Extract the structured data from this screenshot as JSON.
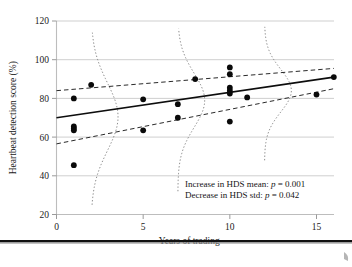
{
  "chart_data": {
    "type": "scatter",
    "title": "",
    "xlabel": "Years of trading",
    "ylabel": "Heartbeat detection score (%)",
    "xlim": [
      -0.6,
      17.2
    ],
    "ylim": [
      18,
      123
    ],
    "xticks": [
      0,
      5,
      10,
      15
    ],
    "xtick_labels": [
      "0",
      "5",
      "10",
      "15"
    ],
    "yticks": [
      20,
      40,
      60,
      80,
      100,
      120
    ],
    "ytick_labels": [
      "20",
      "40",
      "60",
      "80",
      "100",
      "120"
    ],
    "grid": "horizontal",
    "legend": "none",
    "points": [
      {
        "x": 1,
        "y": 80.0
      },
      {
        "x": 1,
        "y": 65.5
      },
      {
        "x": 1,
        "y": 64.5
      },
      {
        "x": 1,
        "y": 63.5
      },
      {
        "x": 1,
        "y": 45.5
      },
      {
        "x": 2,
        "y": 87.0
      },
      {
        "x": 5,
        "y": 79.5
      },
      {
        "x": 5,
        "y": 63.5
      },
      {
        "x": 7,
        "y": 77.0
      },
      {
        "x": 7,
        "y": 70.0
      },
      {
        "x": 8,
        "y": 90.0
      },
      {
        "x": 10,
        "y": 96.0
      },
      {
        "x": 10,
        "y": 92.5
      },
      {
        "x": 10,
        "y": 85.5
      },
      {
        "x": 10,
        "y": 84.0
      },
      {
        "x": 10,
        "y": 82.5
      },
      {
        "x": 10,
        "y": 68.0
      },
      {
        "x": 11,
        "y": 80.5
      },
      {
        "x": 15,
        "y": 82.0
      },
      {
        "x": 16,
        "y": 91.0
      }
    ],
    "fit_line": {
      "name": "regression line",
      "style": "solid",
      "x": [
        0,
        16
      ],
      "y": [
        70.0,
        91.0
      ]
    },
    "bands": [
      {
        "name": "upper band",
        "style": "dashed",
        "x": [
          0,
          16
        ],
        "y": [
          84.0,
          95.5
        ]
      },
      {
        "name": "lower band",
        "style": "dashed",
        "x": [
          0,
          16
        ],
        "y": [
          56.5,
          85.0
        ]
      }
    ],
    "density_curves": [
      {
        "name": "distribution at 2 years",
        "style": "dotted",
        "center_x": 2,
        "mean_y": 70.5,
        "sd_y": 17.5,
        "y_range": [
          25,
          114
        ]
      },
      {
        "name": "distribution at 7 years",
        "style": "dotted",
        "center_x": 7,
        "mean_y": 79.0,
        "sd_y": 14.0,
        "y_range": [
          32,
          116
        ]
      },
      {
        "name": "distribution at 12 years",
        "style": "dotted",
        "center_x": 12,
        "mean_y": 84.0,
        "sd_y": 11.0,
        "y_range": [
          48,
          117
        ]
      }
    ],
    "annotations": [
      {
        "id": "mean-trend",
        "prefix": "Increase in HDS mean: ",
        "stat": "p",
        "equals": " = ",
        "value": "0.001"
      },
      {
        "id": "std-trend",
        "prefix": "Decrease in HDS std: ",
        "stat": "p",
        "equals": " = ",
        "value": "0.042"
      }
    ]
  }
}
